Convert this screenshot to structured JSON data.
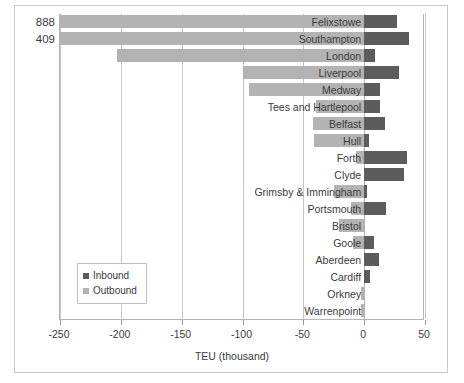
{
  "chart_data": {
    "type": "bar",
    "orientation": "horizontal",
    "stacked": false,
    "title": "",
    "xlabel": "TEU (thousand)",
    "ylabel": "",
    "xlim": [
      -250,
      50
    ],
    "xticks": [
      -250,
      -200,
      -150,
      -100,
      -50,
      0,
      50
    ],
    "xticklabels": [
      "-250",
      "-200",
      "-150",
      "-100",
      "-50",
      "0",
      "50"
    ],
    "grid": "vertical",
    "legend_position": "inside-bottom-left",
    "categories": [
      "Felixstowe",
      "Southampton",
      "London",
      "Liverpool",
      "Medway",
      "Tees and Hartlepool",
      "Belfast",
      "Hull",
      "Forth",
      "Clyde",
      "Grimsby & Immingham",
      "Portsmouth",
      "Bristol",
      "Goole",
      "Aberdeen",
      "Cardiff",
      "Orkney",
      "Warrenpoint"
    ],
    "series": [
      {
        "name": "Inbound",
        "color": "#5c5c5c",
        "values": [
          27,
          37,
          9,
          29,
          13,
          13,
          17,
          4,
          35,
          33,
          2,
          18,
          0,
          8,
          12,
          5,
          0,
          0
        ]
      },
      {
        "name": "Outbound",
        "color": "#b3b3b3",
        "values": [
          -888,
          -409,
          -203,
          -100,
          -95,
          -40,
          -42,
          -41,
          -7,
          0,
          -25,
          -11,
          -21,
          -9,
          0,
          0,
          -3,
          -3
        ],
        "clipped_at": -250
      }
    ],
    "overflow_labels": [
      {
        "category": "Felixstowe",
        "value": "888"
      },
      {
        "category": "Southampton",
        "value": "409"
      }
    ],
    "legend": [
      {
        "label": "Inbound",
        "color": "#5c5c5c"
      },
      {
        "label": "Outbound",
        "color": "#b3b3b3"
      }
    ]
  }
}
